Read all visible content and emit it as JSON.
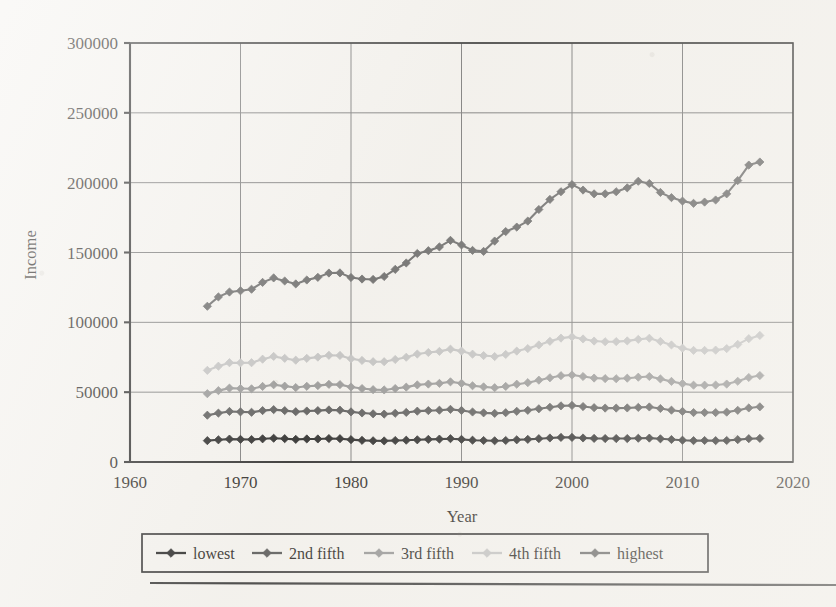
{
  "figure": {
    "type": "scanned-book-figure",
    "axis_titles": {
      "x": "Year",
      "y": "Income"
    }
  },
  "chart_data": {
    "type": "line",
    "title": "",
    "xlabel": "Year",
    "ylabel": "Income",
    "xlim": [
      1960,
      2020
    ],
    "ylim": [
      0,
      300000
    ],
    "xticks": [
      1960,
      1970,
      1980,
      1990,
      2000,
      2010,
      2020
    ],
    "xtick_labels": [
      "1960",
      "1970",
      "1980",
      "1990",
      "2000",
      "2010",
      "2020"
    ],
    "yticks": [
      0,
      50000,
      100000,
      150000,
      200000,
      250000,
      300000
    ],
    "ytick_labels": [
      "0",
      "50000",
      "100000",
      "150000",
      "200000",
      "250000",
      "300000"
    ],
    "grid": true,
    "grid_axes": "both",
    "legend_position": "bottom",
    "marker": "diamond",
    "x": [
      1967,
      1968,
      1969,
      1970,
      1971,
      1972,
      1973,
      1974,
      1975,
      1976,
      1977,
      1978,
      1979,
      1980,
      1981,
      1982,
      1983,
      1984,
      1985,
      1986,
      1987,
      1988,
      1989,
      1990,
      1991,
      1992,
      1993,
      1994,
      1995,
      1996,
      1997,
      1998,
      1999,
      2000,
      2001,
      2002,
      2003,
      2004,
      2005,
      2006,
      2007,
      2008,
      2009,
      2010,
      2011,
      2012,
      2013,
      2014,
      2015,
      2016,
      2017
    ],
    "series": [
      {
        "name": "lowest",
        "color": "#141414",
        "values": [
          15300,
          15900,
          16400,
          16200,
          16100,
          16600,
          17000,
          16700,
          16200,
          16500,
          16500,
          16800,
          16700,
          16000,
          15500,
          15200,
          15100,
          15400,
          15600,
          15900,
          16200,
          16400,
          16700,
          16200,
          15600,
          15400,
          15200,
          15400,
          15900,
          16200,
          16700,
          17200,
          17600,
          17600,
          17200,
          16900,
          16800,
          16800,
          16800,
          17000,
          17100,
          16600,
          16100,
          15600,
          15300,
          15400,
          15300,
          15400,
          16000,
          16700,
          16900
        ]
      },
      {
        "name": "2nd fifth",
        "color": "#4a4a4a",
        "values": [
          33500,
          35000,
          36200,
          35900,
          35600,
          36800,
          37500,
          36800,
          36000,
          36500,
          36800,
          37300,
          37100,
          35900,
          35100,
          34500,
          34300,
          34900,
          35500,
          36400,
          36800,
          37100,
          37700,
          36900,
          35800,
          35200,
          34800,
          35300,
          36300,
          37000,
          38100,
          39200,
          40200,
          40500,
          39700,
          38900,
          38600,
          38600,
          38700,
          39100,
          39400,
          38300,
          37100,
          36200,
          35400,
          35400,
          35400,
          35700,
          37000,
          38700,
          39500
        ]
      },
      {
        "name": "3rd fifth",
        "color": "#8d8d8d",
        "values": [
          48900,
          51100,
          52900,
          52600,
          52400,
          54100,
          55300,
          54300,
          53300,
          54200,
          54700,
          55600,
          55400,
          53700,
          52600,
          51800,
          51600,
          52600,
          53600,
          55200,
          55800,
          56300,
          57400,
          56300,
          54600,
          53800,
          53200,
          54100,
          55700,
          56800,
          58600,
          60300,
          61800,
          62300,
          61200,
          60100,
          59700,
          59600,
          60000,
          60700,
          61200,
          59500,
          57700,
          56100,
          55000,
          55000,
          55100,
          55800,
          57800,
          60500,
          61900
        ]
      },
      {
        "name": "4th fifth",
        "color": "#bdbdbd",
        "values": [
          65600,
          68600,
          71100,
          71000,
          71100,
          73600,
          75600,
          74200,
          72900,
          74200,
          75100,
          76400,
          76300,
          74000,
          72700,
          71800,
          71800,
          73400,
          75000,
          77300,
          78400,
          79200,
          80800,
          79400,
          77200,
          76200,
          75500,
          77000,
          79400,
          81200,
          83800,
          86400,
          88700,
          89600,
          88100,
          86600,
          86100,
          86200,
          86700,
          87800,
          88600,
          86300,
          83800,
          81500,
          79900,
          79900,
          80100,
          81200,
          84200,
          88300,
          90600
        ]
      },
      {
        "name": "highest",
        "color": "#5c5c5c",
        "values": [
          111500,
          118200,
          121700,
          122600,
          123700,
          128600,
          131800,
          129600,
          127500,
          130300,
          132200,
          135300,
          135400,
          132100,
          131000,
          130700,
          132800,
          137900,
          142500,
          149300,
          151300,
          154000,
          158700,
          155400,
          151500,
          150800,
          158200,
          165000,
          168200,
          172500,
          180800,
          188000,
          193500,
          198600,
          194700,
          192000,
          192000,
          193500,
          196300,
          201000,
          199400,
          193000,
          189300,
          186800,
          185200,
          186100,
          187600,
          192000,
          201500,
          212600,
          214800
        ]
      }
    ]
  },
  "legend": {
    "items": [
      {
        "label": "lowest",
        "color": "#141414"
      },
      {
        "label": "2nd fifth",
        "color": "#4a4a4a"
      },
      {
        "label": "3rd fifth",
        "color": "#8d8d8d"
      },
      {
        "label": "4th fifth",
        "color": "#bdbdbd"
      },
      {
        "label": "highest",
        "color": "#5c5c5c"
      }
    ]
  }
}
